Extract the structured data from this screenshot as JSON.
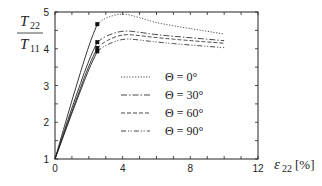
{
  "chart_data": {
    "type": "line",
    "title": "",
    "ylabel_num": "T",
    "ylabel_num_sub": "22",
    "ylabel_den": "T",
    "ylabel_den_sub": "11",
    "xlabel_sym": "ε",
    "xlabel_sub": "22",
    "xlabel_unit": "[%]",
    "xlim": [
      0,
      12
    ],
    "ylim": [
      1,
      5
    ],
    "xticks": [
      "0",
      "4",
      "8",
      "12"
    ],
    "yticks": [
      "1",
      "2",
      "3",
      "4",
      "5"
    ],
    "grid": false,
    "legend_position": "center-right inside",
    "series": [
      {
        "name": "Θ = 0°",
        "style": "dotted",
        "marker_at": [
          2.5,
          4.67
        ],
        "x": [
          0,
          1,
          2,
          2.5,
          3,
          4,
          5,
          6,
          8,
          10
        ],
        "y": [
          1,
          2.6,
          4.1,
          4.67,
          4.85,
          4.97,
          4.85,
          4.7,
          4.55,
          4.4
        ]
      },
      {
        "name": "Θ = 30°",
        "style": "dash-dot",
        "marker_at": [
          2.5,
          4.18
        ],
        "x": [
          0,
          1,
          2,
          2.5,
          3,
          4,
          5,
          6,
          8,
          10
        ],
        "y": [
          1,
          2.4,
          3.7,
          4.18,
          4.35,
          4.5,
          4.45,
          4.38,
          4.3,
          4.22
        ]
      },
      {
        "name": "Θ = 60°",
        "style": "dashed",
        "marker_at": [
          2.5,
          4.02
        ],
        "x": [
          0,
          1,
          2,
          2.5,
          3,
          4,
          5,
          6,
          8,
          10
        ],
        "y": [
          1,
          2.3,
          3.55,
          4.02,
          4.22,
          4.4,
          4.36,
          4.3,
          4.22,
          4.15
        ]
      },
      {
        "name": "Θ = 90°",
        "style": "dash-dot-dot",
        "marker_at": [
          2.5,
          3.93
        ],
        "x": [
          0,
          1,
          2,
          2.5,
          3,
          4,
          5,
          6,
          8,
          10
        ],
        "y": [
          1,
          2.25,
          3.45,
          3.93,
          4.1,
          4.28,
          4.24,
          4.18,
          4.1,
          4.03
        ]
      }
    ]
  }
}
